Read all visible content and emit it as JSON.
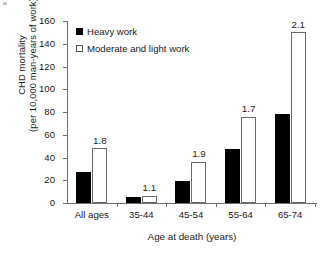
{
  "chart_data": {
    "type": "bar",
    "title": "",
    "xlabel": "Age at death (years)",
    "ylabel_line1": "CHD mortality",
    "ylabel_line2": "(per 10,000 man-years of work)",
    "categories": [
      "All ages",
      "35-44",
      "45-54",
      "55-64",
      "65-74"
    ],
    "series": [
      {
        "name": "Heavy work",
        "values": [
          27,
          5.5,
          19.5,
          47.5,
          78
        ]
      },
      {
        "name": "Moderate and light work",
        "values": [
          48,
          6,
          36,
          76,
          150
        ]
      }
    ],
    "annotations": [
      "1.8",
      "1.1",
      "1.9",
      "1.7",
      "2.1"
    ],
    "ylim": [
      0,
      160
    ],
    "yticks": [
      "160",
      "140",
      "120",
      "100",
      "80",
      "60",
      "40",
      "20",
      "0"
    ],
    "ytick_values": [
      160,
      140,
      120,
      100,
      80,
      60,
      40,
      20,
      0
    ],
    "grid": false,
    "legend_position": "top-left",
    "colors": {
      "heavy": "#000000",
      "moderate": "#ffffff",
      "outline": "#6a6a6a",
      "axis": "#6f6f6f"
    }
  }
}
